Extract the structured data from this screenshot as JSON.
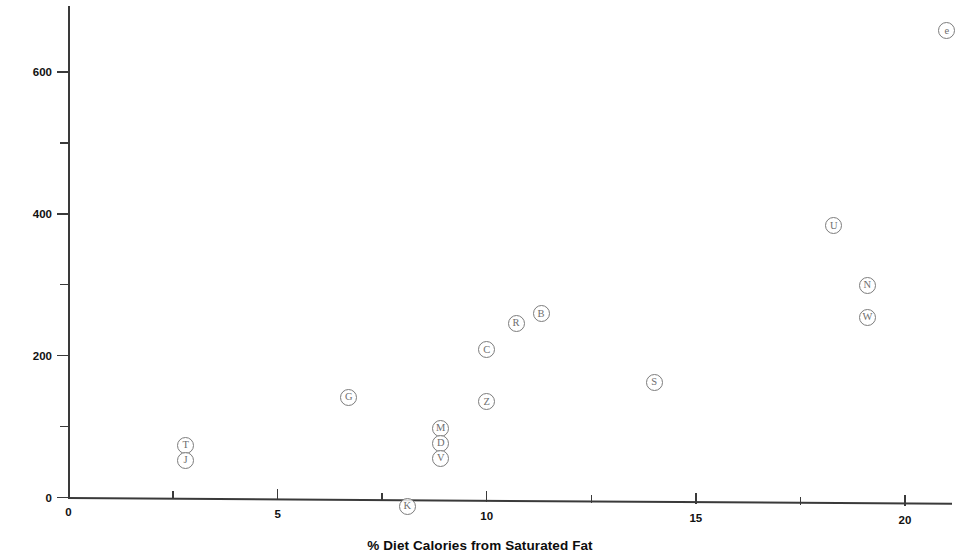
{
  "chart_data": {
    "type": "scatter",
    "title": "",
    "xlabel": "% Diet Calories from Saturated Fat",
    "ylabel": "10-Year Coronary Deaths per 10,000 Men",
    "xlim": [
      0,
      21.4
    ],
    "ylim": [
      0,
      695
    ],
    "grid": false,
    "legend": "none",
    "point_label_style": "circled-letter",
    "xticks": [
      {
        "value": 0,
        "label": "0",
        "major": true
      },
      {
        "value": 2.5,
        "label": "",
        "major": false
      },
      {
        "value": 5,
        "label": "5",
        "major": true
      },
      {
        "value": 7.5,
        "label": "",
        "major": false
      },
      {
        "value": 10,
        "label": "10",
        "major": true
      },
      {
        "value": 12.5,
        "label": "",
        "major": false
      },
      {
        "value": 15,
        "label": "15",
        "major": true
      },
      {
        "value": 17.5,
        "label": "",
        "major": false
      },
      {
        "value": 20,
        "label": "20",
        "major": true
      }
    ],
    "yticks": [
      {
        "value": 0,
        "label": "0",
        "major": true
      },
      {
        "value": 100,
        "label": "",
        "major": false
      },
      {
        "value": 200,
        "label": "200",
        "major": true
      },
      {
        "value": 300,
        "label": "",
        "major": false
      },
      {
        "value": 400,
        "label": "400",
        "major": true
      },
      {
        "value": 500,
        "label": "",
        "major": false
      },
      {
        "value": 600,
        "label": "600",
        "major": true
      }
    ],
    "points": [
      {
        "label": "T",
        "x": 2.8,
        "y": 73
      },
      {
        "label": "J",
        "x": 2.8,
        "y": 52
      },
      {
        "label": "G",
        "x": 6.7,
        "y": 141
      },
      {
        "label": "K",
        "x": 8.1,
        "y": 0
      },
      {
        "label": "M",
        "x": 8.9,
        "y": 98
      },
      {
        "label": "D",
        "x": 8.9,
        "y": 76
      },
      {
        "label": "V",
        "x": 8.9,
        "y": 55
      },
      {
        "label": "C",
        "x": 10.0,
        "y": 208
      },
      {
        "label": "Z",
        "x": 10.0,
        "y": 135
      },
      {
        "label": "R",
        "x": 10.7,
        "y": 246
      },
      {
        "label": "B",
        "x": 11.3,
        "y": 259
      },
      {
        "label": "S",
        "x": 14.0,
        "y": 162
      },
      {
        "label": "U",
        "x": 18.3,
        "y": 383
      },
      {
        "label": "N",
        "x": 19.1,
        "y": 299
      },
      {
        "label": "W",
        "x": 19.1,
        "y": 254
      },
      {
        "label": "e",
        "x": 21.0,
        "y": 658
      }
    ],
    "colors": {
      "axis": "#3a3a3a",
      "marker_stroke": "#7c7c7c",
      "marker_text": "#6e6e6e",
      "label_text": "#0d0d0d",
      "background": "#ffffff"
    }
  }
}
